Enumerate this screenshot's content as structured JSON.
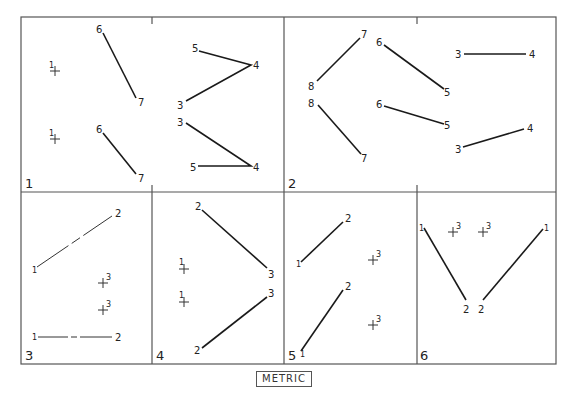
{
  "diagram": {
    "units_label": "METRIC",
    "panels": [
      {
        "number": "1",
        "label": "1"
      },
      {
        "number": "2",
        "label": "2"
      },
      {
        "number": "3",
        "label": "3"
      },
      {
        "number": "4",
        "label": "4"
      },
      {
        "number": "5",
        "label": "5"
      },
      {
        "number": "6",
        "label": "6"
      }
    ],
    "point_labels": {
      "p1": {
        "a_1": "1",
        "a_6": "6",
        "a_7": "7",
        "a_5": "5",
        "a_4": "4",
        "a_3": "3",
        "b_1": "1",
        "b_6": "6",
        "b_7": "7",
        "b_3": "3",
        "b_4": "4",
        "b_5": "5"
      },
      "p2": {
        "a_7": "7",
        "a_8": "8",
        "a_6": "6",
        "a_5": "5",
        "a_3": "3",
        "a_4": "4",
        "b_8": "8",
        "b_7": "7",
        "b_6": "6",
        "b_5": "5",
        "b_3": "3",
        "b_4": "4"
      },
      "p3": {
        "a_1": "1",
        "a_2": "2",
        "a_3": "3",
        "b_3": "3",
        "b_1": "1",
        "b_2": "2"
      },
      "p4": {
        "a_2": "2",
        "a_3": "3",
        "a_1": "1",
        "b_1": "1",
        "b_3": "3",
        "b_2": "2"
      },
      "p5": {
        "a_1": "1",
        "a_2": "2",
        "a_3": "3",
        "b_1": "1",
        "b_2": "2",
        "b_3": "3"
      },
      "p6": {
        "a_1": "1",
        "a_2": "2",
        "a_3": "3",
        "b_1": "1",
        "b_2": "2",
        "b_3": "3"
      }
    }
  }
}
